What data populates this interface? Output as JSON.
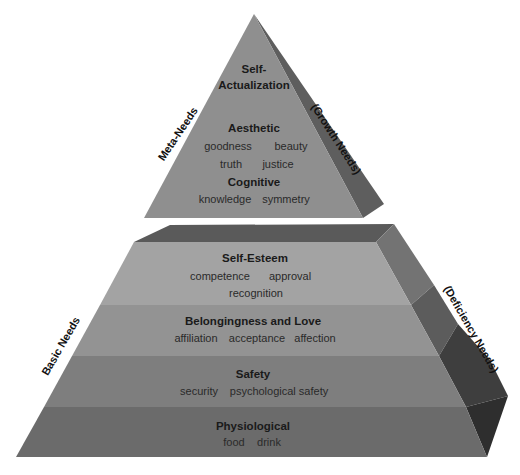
{
  "diagram": {
    "top_pyramid": {
      "left_label": "Meta-Needs",
      "right_label": "(Growth Needs)",
      "levels": [
        {
          "title_lines": [
            "Self-",
            "Actualization"
          ],
          "items": []
        },
        {
          "title_lines": [
            "Aesthetic"
          ],
          "items": [
            [
              "goodness",
              "beauty"
            ],
            [
              "truth",
              "justice"
            ]
          ]
        },
        {
          "title_lines": [
            "Cognitive"
          ],
          "items": [
            [
              "knowledge",
              "symmetry"
            ]
          ]
        }
      ]
    },
    "bottom_pyramid": {
      "left_label": "Basic Needs",
      "right_label": "(Deficiency Needs)",
      "levels": [
        {
          "title": "Self-Esteem",
          "items": [
            [
              "competence",
              "approval"
            ],
            [
              "recognition"
            ]
          ]
        },
        {
          "title": "Belongingness and Love",
          "items": [
            [
              "affiliation",
              "acceptance",
              "affection"
            ]
          ]
        },
        {
          "title": "Safety",
          "items": [
            [
              "security",
              "psychological safety"
            ]
          ]
        },
        {
          "title": "Physiological",
          "items": [
            [
              "food",
              "drink"
            ]
          ]
        }
      ]
    },
    "colors": {
      "top_front": "#8f8f8f",
      "top_side": "#5e5e5e",
      "frustum_top": "#5a5a5a",
      "level_self_esteem": "#a3a3a3",
      "level_belonging": "#939393",
      "level_safety": "#7e7e7e",
      "level_physiological": "#6b6b6b",
      "side_self_esteem": "#737373",
      "side_belonging": "#5c5c5c",
      "side_safety": "#3e3e3e",
      "side_physiological": "#2e2e2e"
    }
  }
}
